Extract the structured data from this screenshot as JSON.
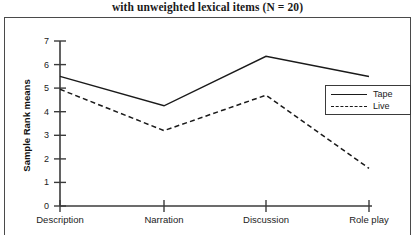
{
  "chart_data": {
    "type": "line",
    "title": "with unweighted lexical items (N = 20)",
    "xlabel": "",
    "ylabel": "Sample Rank means",
    "categories": [
      "Description",
      "Narration",
      "Discussion",
      "Role play"
    ],
    "series": [
      {
        "name": "Tape",
        "style": "solid",
        "color": "#1a1a1a",
        "values": [
          5.5,
          4.25,
          6.35,
          5.5
        ]
      },
      {
        "name": "Live",
        "style": "dashed",
        "color": "#1a1a1a",
        "values": [
          4.95,
          3.2,
          4.7,
          1.6
        ]
      }
    ],
    "ylim": [
      0,
      7
    ],
    "yticks": [
      0,
      1,
      2,
      3,
      4,
      5,
      6,
      7
    ],
    "ytick_labels": [
      "0",
      "1",
      "2",
      "3",
      "4",
      "5",
      "6",
      "7"
    ],
    "grid": false,
    "legend_position": "right-upper",
    "legend_entries": [
      "Tape",
      "Live"
    ]
  },
  "axis": {
    "y_title": "Sample Rank means",
    "y_labels": [
      "7",
      "6",
      "5",
      "4",
      "3",
      "2",
      "1",
      "0"
    ],
    "x_labels": [
      "Description",
      "Narration",
      "Discussion",
      "Role play"
    ]
  },
  "legend": {
    "tape_label": "Tape",
    "live_label": "Live"
  }
}
